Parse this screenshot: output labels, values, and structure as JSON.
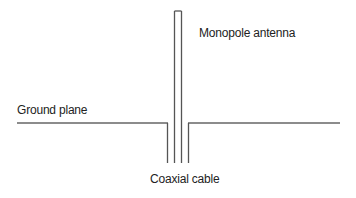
{
  "diagram": {
    "labels": {
      "antenna": "Monopole antenna",
      "ground_plane": "Ground plane",
      "coax": "Coaxial cable"
    },
    "colors": {
      "line": "#555555",
      "text": "#222222",
      "background": "#ffffff"
    }
  }
}
